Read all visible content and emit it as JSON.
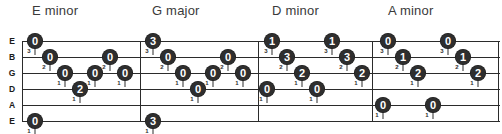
{
  "document": {
    "type": "guitar-tablature",
    "width": 502,
    "height": 134,
    "background_color": "#ffffff",
    "ink_color": "#2e2e2e",
    "note_text_color": "#ffffff",
    "title_color": "#3a3a3a"
  },
  "strings": [
    {
      "label": "E",
      "y": 15
    },
    {
      "label": "B",
      "y": 31
    },
    {
      "label": "G",
      "y": 47
    },
    {
      "label": "D",
      "y": 63
    },
    {
      "label": "A",
      "y": 79
    },
    {
      "label": "E",
      "y": 95
    }
  ],
  "barlines": [
    {
      "x": 22
    },
    {
      "x": 140
    },
    {
      "x": 258
    },
    {
      "x": 372
    },
    {
      "x": 498
    }
  ],
  "sections": [
    {
      "id": "section-e-minor",
      "title": "E minor",
      "title_x": 32,
      "notes": [
        {
          "fret": "0",
          "string": 0,
          "x": 35,
          "finger": "3"
        },
        {
          "fret": "0",
          "string": 1,
          "x": 50,
          "finger": "2"
        },
        {
          "fret": "0",
          "string": 2,
          "x": 65,
          "finger": "1"
        },
        {
          "fret": "2",
          "string": 3,
          "x": 80,
          "finger": "1"
        },
        {
          "fret": "0",
          "string": 2,
          "x": 95,
          "finger": "1"
        },
        {
          "fret": "0",
          "string": 1,
          "x": 110,
          "finger": "2"
        },
        {
          "fret": "0",
          "string": 2,
          "x": 125,
          "finger": "1"
        },
        {
          "fret": "0",
          "string": 5,
          "x": 35,
          "finger": "1"
        }
      ]
    },
    {
      "id": "section-g-major",
      "title": "G major",
      "title_x": 152,
      "notes": [
        {
          "fret": "3",
          "string": 0,
          "x": 153,
          "finger": "3"
        },
        {
          "fret": "0",
          "string": 1,
          "x": 168,
          "finger": "2"
        },
        {
          "fret": "0",
          "string": 2,
          "x": 183,
          "finger": "1"
        },
        {
          "fret": "0",
          "string": 3,
          "x": 198,
          "finger": "1"
        },
        {
          "fret": "0",
          "string": 2,
          "x": 213,
          "finger": "1"
        },
        {
          "fret": "0",
          "string": 1,
          "x": 228,
          "finger": "2"
        },
        {
          "fret": "0",
          "string": 2,
          "x": 243,
          "finger": "1"
        },
        {
          "fret": "3",
          "string": 5,
          "x": 153,
          "finger": "1"
        }
      ]
    },
    {
      "id": "section-d-minor",
      "title": "D minor",
      "title_x": 272,
      "notes": [
        {
          "fret": "1",
          "string": 0,
          "x": 272,
          "finger": "3"
        },
        {
          "fret": "3",
          "string": 1,
          "x": 287,
          "finger": "2"
        },
        {
          "fret": "2",
          "string": 2,
          "x": 302,
          "finger": "1"
        },
        {
          "fret": "0",
          "string": 3,
          "x": 267,
          "finger": "1"
        },
        {
          "fret": "0",
          "string": 3,
          "x": 317,
          "finger": "1"
        },
        {
          "fret": "1",
          "string": 0,
          "x": 332,
          "finger": "3"
        },
        {
          "fret": "3",
          "string": 1,
          "x": 347,
          "finger": "2"
        },
        {
          "fret": "2",
          "string": 2,
          "x": 362,
          "finger": "1"
        }
      ]
    },
    {
      "id": "section-a-minor",
      "title": "A minor",
      "title_x": 388,
      "notes": [
        {
          "fret": "0",
          "string": 0,
          "x": 388,
          "finger": "3"
        },
        {
          "fret": "1",
          "string": 1,
          "x": 403,
          "finger": "2"
        },
        {
          "fret": "2",
          "string": 2,
          "x": 418,
          "finger": "1"
        },
        {
          "fret": "0",
          "string": 4,
          "x": 383,
          "finger": "1"
        },
        {
          "fret": "0",
          "string": 4,
          "x": 433,
          "finger": "1"
        },
        {
          "fret": "0",
          "string": 0,
          "x": 448,
          "finger": "3"
        },
        {
          "fret": "1",
          "string": 1,
          "x": 463,
          "finger": "2"
        },
        {
          "fret": "2",
          "string": 2,
          "x": 478,
          "finger": "1"
        }
      ]
    }
  ]
}
